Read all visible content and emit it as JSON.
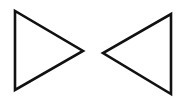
{
  "diagram": {
    "background": "#ffffff",
    "stroke_color": "#111111",
    "shapes": [
      {
        "type": "triangle",
        "direction": "right",
        "points": "15,11 15,90 83,51"
      },
      {
        "type": "triangle",
        "direction": "left",
        "points": "171,14 171,94 103,53"
      }
    ]
  }
}
